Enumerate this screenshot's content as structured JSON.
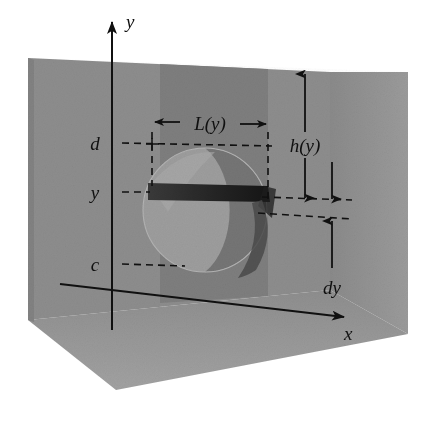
{
  "figure": {
    "kind": "3d-diagram",
    "background_color": "#ffffff",
    "ink_color": "#101010"
  },
  "labels": {
    "y_axis": "y",
    "x_axis": "x",
    "upper_bound": "d",
    "strip_level": "y",
    "lower_bound": "c",
    "strip_length": "L(y)",
    "depth": "h(y)",
    "thickness": "dy"
  },
  "colors": {
    "back_wall": "#8d8d8d",
    "back_wall_shadow": "#7b7b7b",
    "side_wall_right": "#959595",
    "floor": "#9a9a9a",
    "floor_front": "#8f8f8f",
    "plate_face": "#9d9d9d",
    "plate_shadow": "#6d6d6d",
    "strip_dark": "#2b2b2b",
    "strip_edge": "#1a1a1a",
    "ink": "#101010"
  },
  "geometry": {
    "y_axis": {
      "x": 112,
      "y_top": 14,
      "y_bottom": 330
    },
    "x_axis": {
      "x_start": 60,
      "y_start": 284,
      "x_end": 352,
      "y_end": 318
    },
    "levels": {
      "d": 143,
      "y": 192,
      "c": 264
    },
    "strip": {
      "left": 148,
      "right": 268,
      "top": 183,
      "bottom": 200
    },
    "plate": {
      "cx": 205,
      "cy": 210,
      "r": 62
    },
    "L_annotation": {
      "x_left": 152,
      "x_right": 268,
      "y": 122
    },
    "h_annotation": {
      "x": 305,
      "y_top": 72,
      "y_bottom": 200,
      "label_y": 144
    },
    "dy_annotation": {
      "x": 332,
      "y_top": 192,
      "y_bottom": 252,
      "label_y": 285
    }
  },
  "annotation_values": {
    "L_of_y_arrow": "double-headed-horizontal",
    "h_of_y_arrow": "double-headed-vertical",
    "dy_arrow": "double-headed-vertical-short"
  }
}
